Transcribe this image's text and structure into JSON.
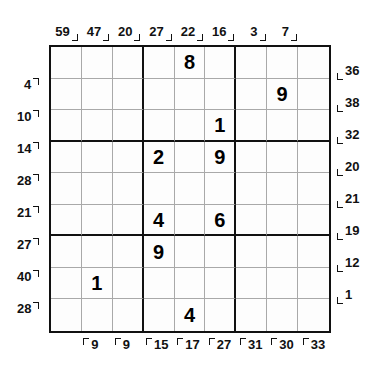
{
  "puzzle": {
    "type": "sum-sudoku",
    "grid_size": 9,
    "box_size": 3,
    "colors": {
      "thick_line": "#111111",
      "thin_line": "#a9a9a9",
      "digit": "#000000",
      "background": "#ffffff"
    },
    "givens": [
      {
        "row": 1,
        "col": 5,
        "value": "8"
      },
      {
        "row": 2,
        "col": 8,
        "value": "9"
      },
      {
        "row": 3,
        "col": 6,
        "value": "1"
      },
      {
        "row": 4,
        "col": 4,
        "value": "2"
      },
      {
        "row": 4,
        "col": 6,
        "value": "9"
      },
      {
        "row": 6,
        "col": 4,
        "value": "4"
      },
      {
        "row": 6,
        "col": 6,
        "value": "6"
      },
      {
        "row": 7,
        "col": 4,
        "value": "9"
      },
      {
        "row": 8,
        "col": 2,
        "value": "1"
      },
      {
        "row": 9,
        "col": 5,
        "value": "4"
      }
    ],
    "cells": [
      [
        "",
        "",
        "",
        "",
        "8",
        "",
        "",
        "",
        ""
      ],
      [
        "",
        "",
        "",
        "",
        "",
        "",
        "",
        "9",
        ""
      ],
      [
        "",
        "",
        "",
        "",
        "",
        "1",
        "",
        "",
        ""
      ],
      [
        "",
        "",
        "",
        "2",
        "",
        "9",
        "",
        "",
        ""
      ],
      [
        "",
        "",
        "",
        "",
        "",
        "",
        "",
        "",
        ""
      ],
      [
        "",
        "",
        "",
        "4",
        "",
        "6",
        "",
        "",
        ""
      ],
      [
        "",
        "",
        "",
        "9",
        "",
        "",
        "",
        "",
        ""
      ],
      [
        "",
        "1",
        "",
        "",
        "",
        "",
        "",
        "",
        ""
      ],
      [
        "",
        "",
        "",
        "",
        "4",
        "",
        "",
        "",
        ""
      ]
    ],
    "clues": {
      "top": [
        {
          "col": 1,
          "value": "59"
        },
        {
          "col": 2,
          "value": "47"
        },
        {
          "col": 3,
          "value": "20"
        },
        {
          "col": 4,
          "value": "27"
        },
        {
          "col": 5,
          "value": "22"
        },
        {
          "col": 6,
          "value": "16"
        },
        {
          "col": 7,
          "value": "3"
        },
        {
          "col": 8,
          "value": "7"
        }
      ],
      "left": [
        {
          "row": 2,
          "value": "4"
        },
        {
          "row": 3,
          "value": "10"
        },
        {
          "row": 4,
          "value": "14"
        },
        {
          "row": 5,
          "value": "28"
        },
        {
          "row": 6,
          "value": "21"
        },
        {
          "row": 7,
          "value": "27"
        },
        {
          "row": 8,
          "value": "40"
        },
        {
          "row": 9,
          "value": "28"
        }
      ],
      "right": [
        {
          "row": 1,
          "value": "36"
        },
        {
          "row": 2,
          "value": "38"
        },
        {
          "row": 3,
          "value": "32"
        },
        {
          "row": 4,
          "value": "20"
        },
        {
          "row": 5,
          "value": "21"
        },
        {
          "row": 6,
          "value": "19"
        },
        {
          "row": 7,
          "value": "12"
        },
        {
          "row": 8,
          "value": "1"
        }
      ],
      "bottom": [
        {
          "col": 2,
          "value": "9"
        },
        {
          "col": 3,
          "value": "9"
        },
        {
          "col": 4,
          "value": "15"
        },
        {
          "col": 5,
          "value": "17"
        },
        {
          "col": 6,
          "value": "27"
        },
        {
          "col": 7,
          "value": "31"
        },
        {
          "col": 8,
          "value": "30"
        },
        {
          "col": 9,
          "value": "33"
        }
      ]
    }
  }
}
